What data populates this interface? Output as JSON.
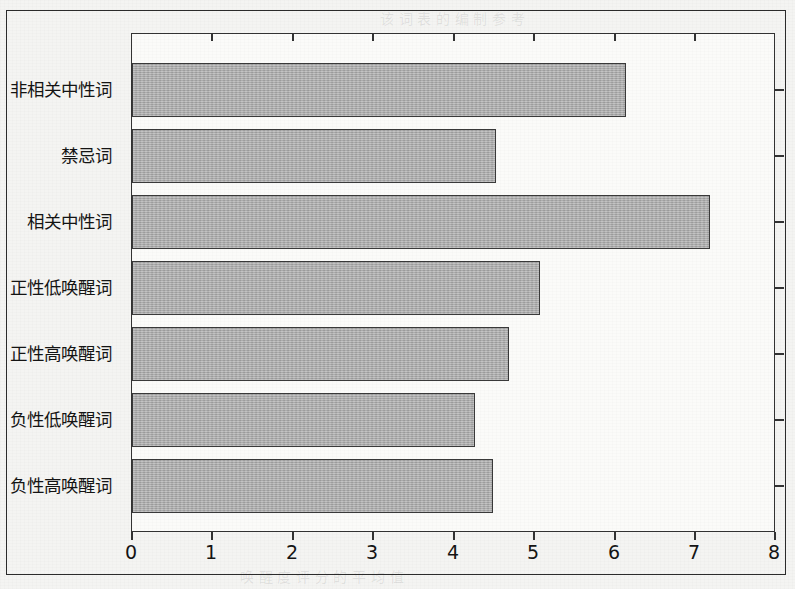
{
  "chart_data": {
    "type": "bar",
    "orientation": "horizontal",
    "title": "",
    "subtitle": "",
    "xlabel": "",
    "ylabel": "",
    "categories": [
      "非相关中性词",
      "禁忌词",
      "相关中性词",
      "正性低唤醒词",
      "正性高唤醒词",
      "负性低唤醒词",
      "负性高唤醒词"
    ],
    "values": [
      6.15,
      4.53,
      7.2,
      5.08,
      4.7,
      4.27,
      4.5
    ],
    "xlim": [
      0,
      8
    ],
    "x_ticks": [
      0,
      1,
      2,
      3,
      4,
      5,
      6,
      7,
      8
    ],
    "x_tick_labels": [
      "0",
      "1",
      "2",
      "3",
      "4",
      "5",
      "6",
      "7",
      "8"
    ],
    "grid": false,
    "legend": null,
    "bar_fill_color": "#a9a9a9",
    "bar_border_color": "#3a3a3a",
    "axis_color": "#333333",
    "background_color": "#fbfbf9"
  },
  "page": {
    "ghost_text": [
      "该 词 表 的 编 制 参 考",
      "实 验 材 料",
      "评 定 结 果 见 表",
      "中 性 词 的 效 价",
      "唤 醒 度 评 分 的 平 均 值"
    ]
  }
}
